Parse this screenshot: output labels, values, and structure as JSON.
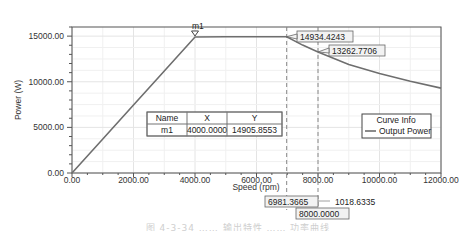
{
  "chart_data": {
    "type": "line",
    "title": "",
    "xlabel": "Speed (rpm)",
    "ylabel": "Power (W)",
    "xlim": [
      0,
      12000
    ],
    "ylim": [
      0,
      16000
    ],
    "grid": true,
    "x_ticks": [
      "0.00",
      "2000.00",
      "4000.00",
      "6000.00",
      "8000.00",
      "10000.00",
      "12000.00"
    ],
    "y_ticks": [
      "0.00",
      "5000.00",
      "10000.00",
      "15000.00"
    ],
    "series": [
      {
        "name": "Output Power",
        "color": "#6e6e6e",
        "x": [
          0,
          1000,
          2000,
          3000,
          4000,
          5000,
          6000,
          6981.3665,
          7500,
          8000,
          9000,
          10000,
          11000,
          12000
        ],
        "y": [
          0,
          3726,
          7453,
          11179,
          14905.8553,
          14934,
          14934,
          14934.4243,
          14020,
          13262.7706,
          11900,
          10900,
          10050,
          9300
        ]
      }
    ],
    "legend": {
      "title": "Curve Info",
      "entries": [
        "Output Power"
      ],
      "position": "right"
    },
    "markers": [
      {
        "name": "m1",
        "x": 4000.0,
        "y": 14905.8553
      }
    ],
    "marker_table": {
      "headers": [
        "Name",
        "X",
        "Y"
      ],
      "rows": [
        [
          "m1",
          "4000.0000",
          "14905.8553"
        ]
      ]
    },
    "annotations": [
      {
        "text": "14934.4243",
        "x": 6981.3665,
        "y": 14934.4243
      },
      {
        "text": "13262.7706",
        "x": 8000,
        "y": 13262.7706
      },
      {
        "text": "6981.3665",
        "type": "x-cursor"
      },
      {
        "text": "8000.0000",
        "type": "x-cursor"
      },
      {
        "text": "1018.6335",
        "type": "delta-x"
      }
    ],
    "cursors": [
      6981.3665,
      8000.0
    ]
  },
  "caption": "图 4-3-34 …… 输出特性 …… 功率曲线"
}
